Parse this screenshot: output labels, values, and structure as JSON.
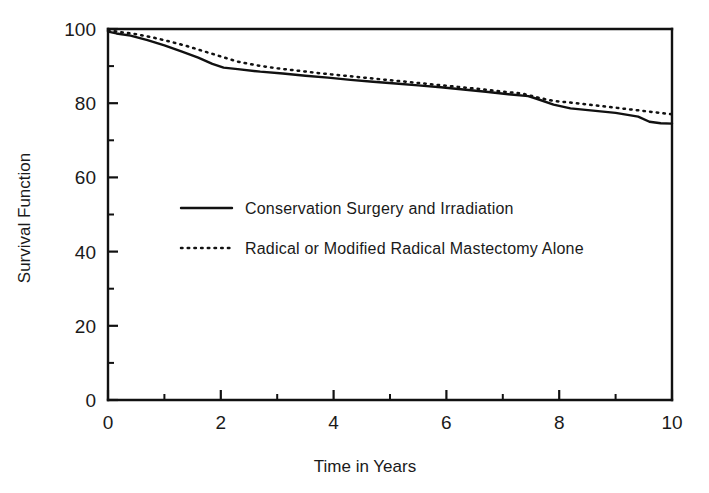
{
  "chart_data": {
    "type": "line",
    "title": "",
    "xlabel": "Time in Years",
    "ylabel": "Survival Function",
    "xlim": [
      0,
      10
    ],
    "ylim": [
      0,
      100
    ],
    "grid": false,
    "legend_position": "center-left-inside",
    "x_ticks_major": [
      0,
      2,
      4,
      6,
      8,
      10
    ],
    "x_tick_labels": [
      "0",
      "2",
      "4",
      "6",
      "8",
      "10"
    ],
    "x_ticks_minor": [
      1,
      3,
      5,
      7,
      9
    ],
    "y_ticks_major": [
      0,
      20,
      40,
      60,
      80,
      100
    ],
    "y_tick_labels": [
      "0",
      "20",
      "40",
      "60",
      "80",
      "100"
    ],
    "y_ticks_minor": [
      10,
      30,
      50,
      70,
      90
    ],
    "series": [
      {
        "name": "Conservation Surgery and Irradiation",
        "style": "solid",
        "x": [
          0.0,
          0.15,
          0.4,
          0.7,
          1.0,
          1.3,
          1.6,
          1.85,
          2.05,
          2.3,
          2.7,
          3.1,
          3.5,
          3.9,
          4.3,
          4.7,
          5.1,
          5.5,
          5.9,
          6.3,
          6.7,
          7.1,
          7.45,
          7.6,
          7.9,
          8.2,
          8.6,
          9.0,
          9.4,
          9.6,
          9.8,
          10.0
        ],
        "y": [
          99.3,
          98.8,
          98.2,
          97.0,
          95.6,
          94.0,
          92.3,
          90.6,
          89.6,
          89.2,
          88.5,
          88.0,
          87.4,
          86.9,
          86.3,
          85.8,
          85.3,
          84.8,
          84.3,
          83.7,
          83.1,
          82.4,
          81.9,
          81.2,
          79.6,
          78.6,
          78.0,
          77.4,
          76.4,
          75.0,
          74.6,
          74.5
        ]
      },
      {
        "name": "Radical or Modified Radical Mastectomy Alone",
        "style": "dotted",
        "x": [
          0.0,
          0.2,
          0.5,
          0.8,
          1.1,
          1.4,
          1.7,
          2.0,
          2.3,
          2.6,
          3.0,
          3.4,
          3.8,
          4.2,
          4.6,
          5.0,
          5.4,
          5.8,
          6.2,
          6.6,
          7.0,
          7.35,
          7.6,
          7.9,
          8.3,
          8.7,
          9.1,
          9.5,
          10.0
        ],
        "y": [
          99.6,
          99.2,
          98.6,
          97.7,
          96.6,
          95.4,
          94.0,
          92.6,
          91.2,
          90.3,
          89.4,
          88.7,
          88.0,
          87.4,
          86.8,
          86.2,
          85.6,
          85.0,
          84.4,
          83.8,
          83.1,
          82.6,
          81.6,
          80.6,
          80.0,
          79.3,
          78.6,
          77.9,
          77.0
        ]
      }
    ],
    "annotations": []
  },
  "legend": {
    "entries": [
      {
        "label": "Conservation Surgery and Irradiation",
        "style": "solid"
      },
      {
        "label": "Radical or Modified Radical Mastectomy Alone",
        "style": "dotted"
      }
    ]
  },
  "colors": {
    "ink": "#111111",
    "background": "#ffffff"
  }
}
